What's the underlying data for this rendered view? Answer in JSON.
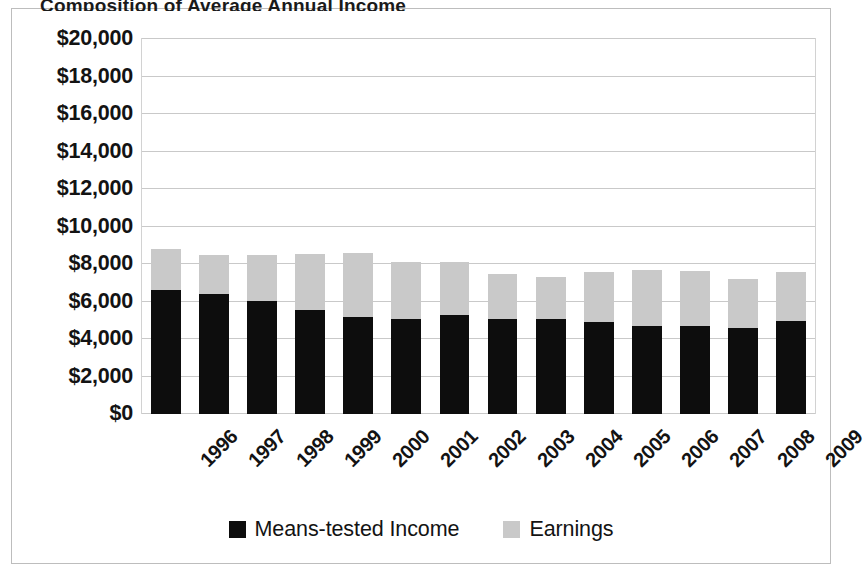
{
  "chart_data": {
    "type": "bar",
    "subtype": "stacked",
    "title": "Composition of Average Annual Income",
    "title_clipped": true,
    "categories": [
      "1996",
      "1997",
      "1998",
      "1999",
      "2000",
      "2001",
      "2002",
      "2003",
      "2004",
      "2005",
      "2006",
      "2007",
      "2008",
      "2009"
    ],
    "series": [
      {
        "name": "Means-tested Income",
        "color": "#0d0d0d",
        "values": [
          6600,
          6400,
          6050,
          5550,
          5200,
          5050,
          5300,
          5050,
          5050,
          4900,
          4700,
          4700,
          4600,
          4950
        ]
      },
      {
        "name": "Earnings",
        "color": "#c9c9c9",
        "values": [
          2200,
          2100,
          2450,
          3000,
          3400,
          3050,
          2800,
          2400,
          2250,
          2700,
          3000,
          2950,
          2600,
          2600
        ]
      }
    ],
    "totals": [
      8800,
      8500,
      8500,
      8550,
      8600,
      8100,
      8100,
      7450,
      7300,
      7600,
      7700,
      7650,
      7200,
      7550
    ],
    "xlabel": "",
    "ylabel": "",
    "ylim": [
      0,
      20000
    ],
    "ytick_step": 2000,
    "ytick_labels": [
      "$20,000",
      "$18,000",
      "$16,000",
      "$14,000",
      "$12,000",
      "$10,000",
      "$8,000",
      "$6,000",
      "$4,000",
      "$2,000",
      "$0"
    ],
    "ytick_values": [
      20000,
      18000,
      16000,
      14000,
      12000,
      10000,
      8000,
      6000,
      4000,
      2000,
      0
    ],
    "grid": true,
    "grid_axis": "y",
    "grid_color": "#c9c9c9",
    "legend_position": "bottom",
    "xtick_rotation": -45,
    "plot_background": "#ffffff",
    "frame_border_color": "#bdbdbd"
  },
  "legend": {
    "items": [
      {
        "label": "Means-tested Income",
        "swatch": "black"
      },
      {
        "label": "Earnings",
        "swatch": "gray"
      }
    ]
  }
}
